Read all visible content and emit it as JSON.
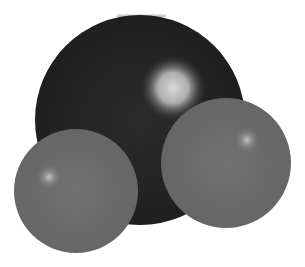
{
  "figure": {
    "title": "Space-filling molecular model",
    "atoms": [
      {
        "role": "central",
        "element": "O",
        "cx": 140,
        "cy": 120,
        "r": 105,
        "color": "#262626",
        "highlight": {
          "cx": 173,
          "cy": 88,
          "r": 32,
          "color": "#d4d4d4"
        }
      },
      {
        "role": "terminal-left",
        "element": "H",
        "cx": 76,
        "cy": 191,
        "r": 62,
        "color": "#6e6e6e",
        "highlight": {
          "cx": 49,
          "cy": 177,
          "r": 12,
          "color": "#bdbdbd"
        }
      },
      {
        "role": "terminal-right",
        "element": "H",
        "cx": 226,
        "cy": 163,
        "r": 65,
        "color": "#6e6e6e",
        "highlight": {
          "cx": 247,
          "cy": 140,
          "r": 12,
          "color": "#bdbdbd"
        }
      }
    ],
    "background": "#ffffff"
  }
}
